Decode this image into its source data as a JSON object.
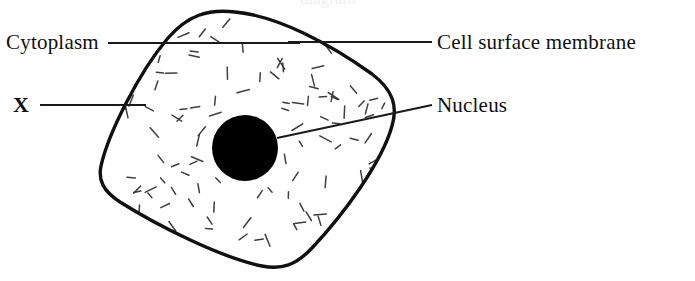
{
  "figure": {
    "background_color": "#ffffff",
    "ink_color": "#101010",
    "clipped_top_fragment": "diagram"
  },
  "labels": {
    "cytoplasm": "Cytoplasm",
    "cell_surface_membrane": "Cell surface membrane",
    "nucleus": "Nucleus",
    "unknown_structure": "X"
  },
  "chart_data": {
    "type": "diagram",
    "parts": [
      {
        "name": "cell-outline",
        "label": "Cell surface membrane",
        "shape": "rounded-rotated-square",
        "stroke": "#101010",
        "stroke_width": 3.4,
        "fill": "#ffffff",
        "path": "M 235 12 C 278 16 330 44 372 74 C 393 90 398 106 392 126 C 382 162 344 214 312 248 C 296 265 282 270 262 266 C 222 258 158 226 120 202 C 103 191 98 180 101 166 C 108 134 139 72 168 38 C 188 15 208 9 235 12 Z"
      },
      {
        "name": "nucleus",
        "label": "Nucleus",
        "shape": "filled-circle",
        "fill": "#000000",
        "center": [
          245,
          148
        ],
        "radius": 33
      },
      {
        "name": "cytoplasm",
        "label": "Cytoplasm",
        "shape": "dash-stipple-fill",
        "stroke": "#3a3a3a",
        "stroke_width": 1.5,
        "dash_count": 150
      }
    ],
    "leader_lines": [
      {
        "name": "cytoplasm-leader",
        "label": "Cytoplasm",
        "x1": 108,
        "y1": 43,
        "x2": 300,
        "y2": 43
      },
      {
        "name": "membrane-leader",
        "label": "Cell surface membrane",
        "x1": 288,
        "y1": 42,
        "x2": 432,
        "y2": 42
      },
      {
        "name": "x-leader",
        "label": "X",
        "x1": 40,
        "y1": 105,
        "x2": 146,
        "y2": 105
      },
      {
        "name": "nucleus-leader",
        "label": "Nucleus",
        "x1": 277,
        "y1": 138,
        "x2": 432,
        "y2": 105
      }
    ],
    "xlabel": "",
    "ylabel": "",
    "legend": []
  }
}
